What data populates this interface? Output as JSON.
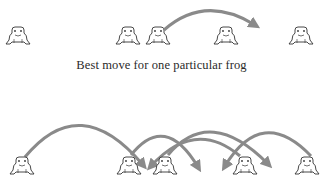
{
  "caption": "Best move for one particular frog",
  "colors": {
    "arrow": "#8a8a8a",
    "frog_outline": "#333333",
    "background": "#ffffff"
  },
  "top_row": {
    "frogs": [
      {
        "x": 18,
        "y": 38
      },
      {
        "x": 128,
        "y": 38
      },
      {
        "x": 158,
        "y": 38
      },
      {
        "x": 226,
        "y": 38
      },
      {
        "x": 301,
        "y": 38
      }
    ],
    "arrows": [
      {
        "from": [
          164,
          30
        ],
        "ctrl": [
          205,
          -6
        ],
        "to": [
          255,
          25
        ]
      }
    ]
  },
  "bottom_row": {
    "frogs": [
      {
        "x": 22,
        "y": 168
      },
      {
        "x": 129,
        "y": 168
      },
      {
        "x": 165,
        "y": 168
      },
      {
        "x": 245,
        "y": 168
      },
      {
        "x": 307,
        "y": 168
      }
    ],
    "arrows": [
      {
        "from": [
          25,
          157
        ],
        "ctrl": [
          80,
          90
        ],
        "to": [
          143,
          165
        ]
      },
      {
        "from": [
          131,
          155
        ],
        "ctrl": [
          165,
          112
        ],
        "to": [
          198,
          167
        ]
      },
      {
        "from": [
          168,
          155
        ],
        "ctrl": [
          210,
          105
        ],
        "to": [
          268,
          164
        ]
      },
      {
        "from": [
          240,
          156
        ],
        "ctrl": [
          195,
          118
        ],
        "to": [
          151,
          166
        ]
      },
      {
        "from": [
          311,
          156
        ],
        "ctrl": [
          262,
          105
        ],
        "to": [
          225,
          166
        ]
      }
    ]
  }
}
